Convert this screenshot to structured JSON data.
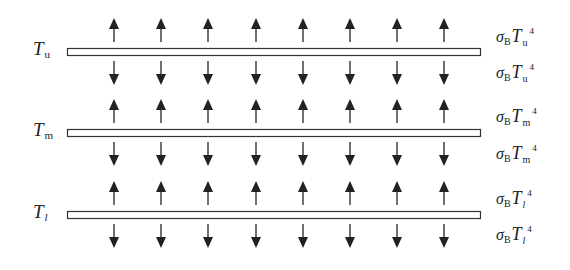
{
  "diagram": {
    "title": "",
    "colors": {
      "line": "#333333",
      "bar_fill": "#ffffff",
      "text": "#222222"
    },
    "arrow_x": [
      114,
      161,
      208,
      256,
      303,
      350,
      397,
      444
    ],
    "layers": [
      {
        "id": "upper",
        "label_T": "T",
        "label_sub": "u",
        "sub_italic": false,
        "bar_y": 48,
        "flux_up": {
          "sigma": "σ",
          "sigma_sub": "B",
          "T": "T",
          "T_sub": "u",
          "power": "4"
        },
        "flux_down": {
          "sigma": "σ",
          "sigma_sub": "B",
          "T": "T",
          "T_sub": "u",
          "power": "4"
        }
      },
      {
        "id": "middle",
        "label_T": "T",
        "label_sub": "m",
        "sub_italic": false,
        "bar_y": 129,
        "flux_up": {
          "sigma": "σ",
          "sigma_sub": "B",
          "T": "T",
          "T_sub": "m",
          "power": "4"
        },
        "flux_down": {
          "sigma": "σ",
          "sigma_sub": "B",
          "T": "T",
          "T_sub": "m",
          "power": "4"
        }
      },
      {
        "id": "lower",
        "label_T": "T",
        "label_sub": "l",
        "sub_italic": true,
        "bar_y": 211,
        "flux_up": {
          "sigma": "σ",
          "sigma_sub": "B",
          "T": "T",
          "T_sub": "l",
          "power": "4"
        },
        "flux_down": {
          "sigma": "σ",
          "sigma_sub": "B",
          "T": "T",
          "T_sub": "l",
          "power": "4"
        }
      }
    ]
  }
}
